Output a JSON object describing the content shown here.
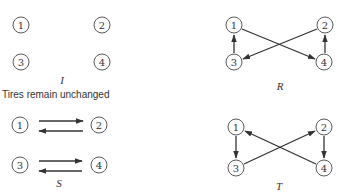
{
  "diagram": {
    "panels": [
      {
        "id": "I",
        "label": "I",
        "caption": "Tires remain unchanged",
        "nodes": [
          {
            "label": "1",
            "x": 21,
            "y": 25
          },
          {
            "label": "2",
            "x": 102,
            "y": 25
          },
          {
            "label": "3",
            "x": 21,
            "y": 62
          },
          {
            "label": "4",
            "x": 102,
            "y": 62
          }
        ],
        "edges": [],
        "label_pos": {
          "x": 62,
          "y": 84
        }
      },
      {
        "id": "R",
        "label": "R",
        "nodes": [
          {
            "label": "1",
            "x": 234,
            "y": 25
          },
          {
            "label": "2",
            "x": 325,
            "y": 25
          },
          {
            "label": "3",
            "x": 234,
            "y": 62
          },
          {
            "label": "4",
            "x": 324,
            "y": 62
          }
        ],
        "edges": [
          {
            "from": "3",
            "to": "1"
          },
          {
            "from": "1",
            "to": "4"
          },
          {
            "from": "2",
            "to": "3"
          },
          {
            "from": "4",
            "to": "2"
          }
        ],
        "label_pos": {
          "x": 280,
          "y": 90
        }
      },
      {
        "id": "S",
        "label": "S",
        "nodes": [
          {
            "label": "1",
            "x": 20,
            "y": 125
          },
          {
            "label": "2",
            "x": 99,
            "y": 125
          },
          {
            "label": "3",
            "x": 20,
            "y": 165
          },
          {
            "label": "4",
            "x": 99,
            "y": 165
          }
        ],
        "edges": [
          {
            "from": "1",
            "to": "2"
          },
          {
            "from": "2",
            "to": "1"
          },
          {
            "from": "3",
            "to": "4"
          },
          {
            "from": "4",
            "to": "3"
          }
        ],
        "label_pos": {
          "x": 59,
          "y": 187
        }
      },
      {
        "id": "T",
        "label": "T",
        "nodes": [
          {
            "label": "1",
            "x": 236,
            "y": 127
          },
          {
            "label": "2",
            "x": 324,
            "y": 127
          },
          {
            "label": "3",
            "x": 236,
            "y": 168
          },
          {
            "label": "4",
            "x": 324,
            "y": 168
          }
        ],
        "edges": [
          {
            "from": "1",
            "to": "3"
          },
          {
            "from": "3",
            "to": "2"
          },
          {
            "from": "2",
            "to": "4"
          },
          {
            "from": "4",
            "to": "1"
          }
        ],
        "label_pos": {
          "x": 279,
          "y": 190
        }
      }
    ]
  }
}
